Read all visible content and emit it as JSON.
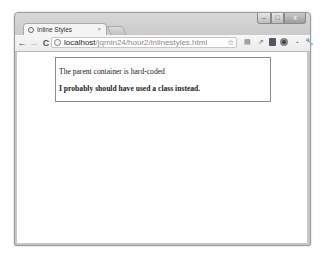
{
  "window": {
    "controls": {
      "minimize": "–",
      "maximize": "□",
      "close": "x"
    }
  },
  "tab": {
    "title": "Inline Styles",
    "close": "×"
  },
  "toolbar": {
    "back": "←",
    "forward": "→",
    "reload": "C",
    "url_host": "localhost",
    "url_path": "/jqmin24/hour2/inlinestyles.html",
    "star": "☆",
    "extensions": [
      "page-action",
      "share",
      "bookmark-doc",
      "opera",
      "clock",
      "wrench"
    ],
    "extension_glyphs": {
      "page_action": "▤",
      "share": "⇗",
      "clock": "◔",
      "wrench": "🔧"
    }
  },
  "page": {
    "paragraph1": "The parent container is hard-coded",
    "paragraph2": "I probably should have used a class instead."
  }
}
